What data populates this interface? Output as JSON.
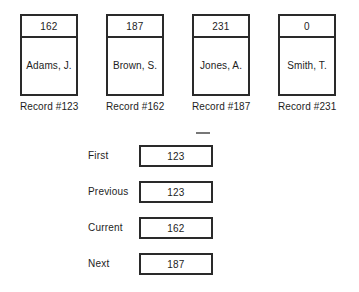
{
  "diagram": {
    "records": [
      {
        "pointer": "162",
        "name": "Adams, J.",
        "caption": "Record #123"
      },
      {
        "pointer": "187",
        "name": "Brown, S.",
        "caption": "Record #162"
      },
      {
        "pointer": "231",
        "name": "Jones, A.",
        "caption": "Record #187"
      },
      {
        "pointer": "0",
        "name": "Smith, T.",
        "caption": "Record #231"
      }
    ],
    "pointer_fields": [
      {
        "label": "First",
        "value": "123"
      },
      {
        "label": "Previous",
        "value": "123"
      },
      {
        "label": "Current",
        "value": "162"
      },
      {
        "label": "Next",
        "value": "187"
      }
    ],
    "colors": {
      "background": "#ffffff",
      "stroke": "#2a2a2a",
      "text": "#1d1d1d"
    }
  }
}
